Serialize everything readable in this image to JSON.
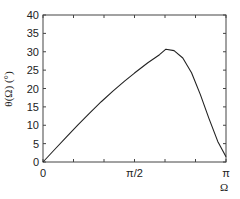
{
  "chart_data": {
    "type": "line",
    "title": "",
    "xlabel": "Ω",
    "ylabel": "θ(Ω) (°)",
    "xlim": [
      0,
      3.14159
    ],
    "ylim": [
      0,
      40
    ],
    "grid": false,
    "legend": null,
    "x_ticks": [
      {
        "value": 0,
        "label": "0"
      },
      {
        "value": 1.5708,
        "label": "π/2"
      },
      {
        "value": 3.14159,
        "label": "π"
      }
    ],
    "y_ticks": [
      {
        "value": 0,
        "label": "0"
      },
      {
        "value": 5,
        "label": "5"
      },
      {
        "value": 10,
        "label": "10"
      },
      {
        "value": 15,
        "label": "15"
      },
      {
        "value": 20,
        "label": "20"
      },
      {
        "value": 25,
        "label": "25"
      },
      {
        "value": 30,
        "label": "30"
      },
      {
        "value": 35,
        "label": "35"
      },
      {
        "value": 40,
        "label": "40"
      }
    ],
    "series": [
      {
        "name": "θ(Ω)",
        "color": "#222222",
        "x": [
          0,
          0.2,
          0.4,
          0.6,
          0.8,
          1.0,
          1.2,
          1.4,
          1.571,
          1.8,
          2.0,
          2.11,
          2.25,
          2.4,
          2.55,
          2.7,
          2.85,
          3.0,
          3.1416
        ],
        "y": [
          0,
          3.4,
          6.8,
          10.1,
          13.3,
          16.4,
          19.3,
          22.0,
          24.2,
          27.0,
          29.2,
          30.7,
          30.3,
          28.3,
          24.3,
          18.4,
          11.8,
          5.6,
          1.4
        ]
      }
    ]
  }
}
